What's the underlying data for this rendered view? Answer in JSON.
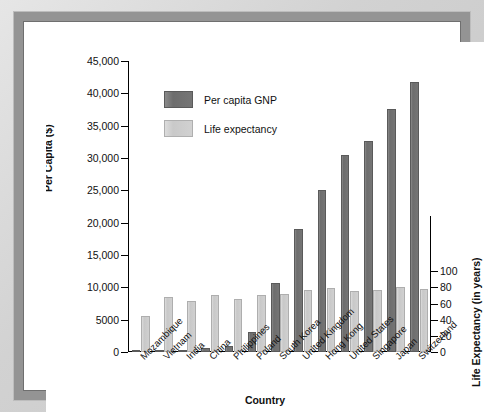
{
  "chart_data": {
    "type": "bar",
    "title": "",
    "xlabel": "Country",
    "ylabel": "Per Capita ($)",
    "ylabel_right": "Life Expectancy (in years)",
    "categories": [
      "Mozambique",
      "Vietnam",
      "India",
      "China",
      "Philippines",
      "Poland",
      "South Korea",
      "United Kingdom",
      "Hong Kong",
      "United States",
      "Singapore",
      "Japan",
      "Switzerland"
    ],
    "series": [
      {
        "name": "Per capita GNP",
        "axis": "left",
        "units": "US dollars",
        "color": "#6d6d6d",
        "values": [
          90,
          240,
          380,
          620,
          860,
          3100,
          10600,
          19000,
          25000,
          30400,
          32700,
          37600,
          41700
        ]
      },
      {
        "name": "Life expectancy",
        "axis": "right",
        "units": "years",
        "color": "#cacaca",
        "values": [
          45,
          68,
          63,
          70,
          66,
          71,
          72,
          77,
          79,
          76,
          77,
          80,
          78
        ]
      }
    ],
    "yticks_left": [
      "0",
      "5000",
      "10,000",
      "15,000",
      "20,000",
      "25,000",
      "30,000",
      "35,000",
      "40,000",
      "45,000"
    ],
    "yticks_left_values": [
      0,
      5000,
      10000,
      15000,
      20000,
      25000,
      30000,
      35000,
      40000,
      45000
    ],
    "ylim_left": [
      0,
      45000
    ],
    "yticks_right": [
      "0",
      "20",
      "40",
      "60",
      "80",
      "100"
    ],
    "yticks_right_values": [
      0,
      20,
      40,
      60,
      80,
      100
    ],
    "ylim_right": [
      0,
      100
    ],
    "right_axis_top_value_on_left_scale": 12500,
    "grid": false,
    "legend_position": "upper-left-inside"
  },
  "legend": {
    "entries": [
      {
        "label": "Per capita GNP"
      },
      {
        "label": "Life expectancy"
      }
    ]
  },
  "colors": {
    "gnp_bar": "#6d6d6d",
    "life_bar": "#cacaca",
    "frame": "#949494",
    "background": "#ffffff",
    "axis": "#000000"
  }
}
